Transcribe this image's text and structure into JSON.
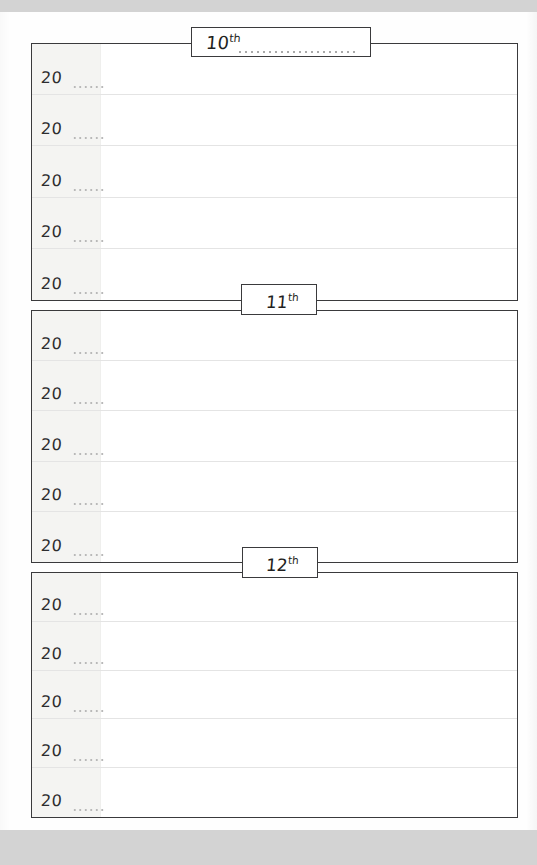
{
  "page": {
    "kind": "planner-page",
    "paper_color": "#fefefe",
    "scan_band_color": "#d3d3d3",
    "frame_color": "#3a3a3c",
    "gutter_color": "#f4f4f2",
    "rule_color": "#e4e4e4"
  },
  "sections": [
    {
      "tab": {
        "number": "10",
        "ordinal": "th",
        "has_write_in_line": true
      },
      "rows": [
        {
          "year_prefix": "20",
          "has_dots": true,
          "note": ""
        },
        {
          "year_prefix": "20",
          "has_dots": true,
          "note": ""
        },
        {
          "year_prefix": "20",
          "has_dots": true,
          "note": ""
        },
        {
          "year_prefix": "20",
          "has_dots": true,
          "note": ""
        },
        {
          "year_prefix": "20",
          "has_dots": true,
          "note": ""
        }
      ]
    },
    {
      "tab": {
        "number": "11",
        "ordinal": "th",
        "has_write_in_line": false
      },
      "rows": [
        {
          "year_prefix": "20",
          "has_dots": true,
          "note": ""
        },
        {
          "year_prefix": "20",
          "has_dots": true,
          "note": ""
        },
        {
          "year_prefix": "20",
          "has_dots": true,
          "note": ""
        },
        {
          "year_prefix": "20",
          "has_dots": true,
          "note": ""
        },
        {
          "year_prefix": "20",
          "has_dots": true,
          "note": ""
        }
      ]
    },
    {
      "tab": {
        "number": "12",
        "ordinal": "th",
        "has_write_in_line": false
      },
      "rows": [
        {
          "year_prefix": "20",
          "has_dots": true,
          "note": ""
        },
        {
          "year_prefix": "20",
          "has_dots": true,
          "note": ""
        },
        {
          "year_prefix": "20",
          "has_dots": true,
          "note": ""
        },
        {
          "year_prefix": "20",
          "has_dots": true,
          "note": ""
        },
        {
          "year_prefix": "20",
          "has_dots": true,
          "note": ""
        }
      ]
    }
  ]
}
